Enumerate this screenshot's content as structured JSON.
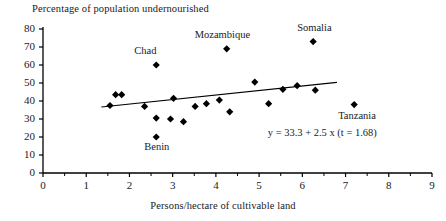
{
  "chart_data": {
    "type": "scatter",
    "title": "",
    "ylabel": "Percentage of population undernourished",
    "xlabel": "Persons/hectare of cultivable land",
    "xlim": [
      0,
      9
    ],
    "ylim": [
      0,
      80
    ],
    "xticks": [
      "0",
      "1",
      "2",
      "3",
      "4",
      "5",
      "6",
      "7",
      "8",
      "9"
    ],
    "yticks": [
      "0",
      "10",
      "20",
      "30",
      "40",
      "50",
      "60",
      "70",
      "80"
    ],
    "xtick_values": [
      0,
      1,
      2,
      3,
      4,
      5,
      6,
      7,
      8,
      9
    ],
    "ytick_values": [
      0,
      10,
      20,
      30,
      40,
      50,
      60,
      70,
      80
    ],
    "minor_xtick_step": 0.5,
    "grid": false,
    "legend": false,
    "marker": "diamond",
    "marker_color": "#000000",
    "line_color": "#000000",
    "annotation": "y = 33.3 + 2.5 x (t = 1.68)",
    "annotation_x": 5.2,
    "annotation_y": 21.5,
    "trendline": {
      "intercept": 33.3,
      "slope": 2.5,
      "t_stat": 1.68,
      "x_start": 1.35,
      "x_end": 6.8
    },
    "points": [
      {
        "x": 1.55,
        "y": 37.5,
        "label": ""
      },
      {
        "x": 1.68,
        "y": 43.5,
        "label": ""
      },
      {
        "x": 1.82,
        "y": 43.5,
        "label": ""
      },
      {
        "x": 2.62,
        "y": 60.0,
        "label": "Chad",
        "label_dx": -22,
        "label_dy": -13
      },
      {
        "x": 2.35,
        "y": 37.0,
        "label": ""
      },
      {
        "x": 2.62,
        "y": 30.5,
        "label": ""
      },
      {
        "x": 2.95,
        "y": 30.0,
        "label": ""
      },
      {
        "x": 3.02,
        "y": 41.5,
        "label": ""
      },
      {
        "x": 3.25,
        "y": 28.5,
        "label": ""
      },
      {
        "x": 2.62,
        "y": 20.0,
        "label": "Benin",
        "label_dx": -12,
        "label_dy": 11
      },
      {
        "x": 3.52,
        "y": 37.0,
        "label": ""
      },
      {
        "x": 3.78,
        "y": 38.5,
        "label": ""
      },
      {
        "x": 4.08,
        "y": 40.5,
        "label": ""
      },
      {
        "x": 4.25,
        "y": 69.0,
        "label": "Mozambique",
        "label_dx": -32,
        "label_dy": -13
      },
      {
        "x": 4.32,
        "y": 34.0,
        "label": ""
      },
      {
        "x": 4.9,
        "y": 50.5,
        "label": ""
      },
      {
        "x": 5.22,
        "y": 38.5,
        "label": ""
      },
      {
        "x": 5.55,
        "y": 46.5,
        "label": ""
      },
      {
        "x": 5.88,
        "y": 48.5,
        "label": ""
      },
      {
        "x": 6.25,
        "y": 73.0,
        "label": "Somalia",
        "label_dx": -16,
        "label_dy": -13
      },
      {
        "x": 6.3,
        "y": 46.0,
        "label": ""
      },
      {
        "x": 7.2,
        "y": 38.0,
        "label": "Tanzania",
        "label_dx": -16,
        "label_dy": 12
      }
    ]
  }
}
